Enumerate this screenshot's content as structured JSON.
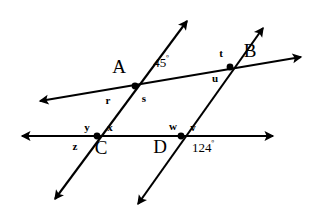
{
  "figure": {
    "type": "geometry-diagram",
    "background_color": "#ffffff",
    "stroke_color": "#000000",
    "lines": [
      {
        "name": "line-through-A-and-B",
        "x1": 40,
        "y1": 101,
        "x2": 301,
        "y2": 57,
        "arrow_start": true,
        "arrow_end": true
      },
      {
        "name": "line-through-C-and-D",
        "x1": 22,
        "y1": 136,
        "x2": 273,
        "y2": 136,
        "arrow_start": true,
        "arrow_end": true
      },
      {
        "name": "transversal-through-A-and-C",
        "x1": 187,
        "y1": 21,
        "x2": 55,
        "y2": 199,
        "arrow_start": true,
        "arrow_end": true
      },
      {
        "name": "transversal-through-B-and-D",
        "x1": 263,
        "y1": 28,
        "x2": 138,
        "y2": 204,
        "arrow_start": true,
        "arrow_end": true
      }
    ],
    "vertices": [
      {
        "name": "vertex-A",
        "x": 135,
        "y": 86
      },
      {
        "name": "vertex-B",
        "x": 230,
        "y": 67
      },
      {
        "name": "vertex-C",
        "x": 97,
        "y": 136
      },
      {
        "name": "vertex-D",
        "x": 181,
        "y": 136
      }
    ],
    "point_labels": [
      {
        "name": "point-label-A",
        "text": "A",
        "x": 119,
        "y": 66
      },
      {
        "name": "point-label-B",
        "text": "B",
        "x": 250,
        "y": 50
      },
      {
        "name": "point-label-C",
        "text": "C",
        "x": 101,
        "y": 147
      },
      {
        "name": "point-label-D",
        "text": "D",
        "x": 160,
        "y": 146
      }
    ],
    "angle_measures": [
      {
        "name": "angle-measure-45",
        "value": "45",
        "unit": "º",
        "x": 161,
        "y": 62
      },
      {
        "name": "angle-measure-124",
        "value": "124",
        "unit": "º",
        "x": 203,
        "y": 147
      }
    ],
    "angle_labels": [
      {
        "name": "angle-label-r",
        "text": "r",
        "x": 108,
        "y": 100
      },
      {
        "name": "angle-label-s",
        "text": "s",
        "x": 144,
        "y": 98
      },
      {
        "name": "angle-label-t",
        "text": "t",
        "x": 221,
        "y": 53
      },
      {
        "name": "angle-label-u",
        "text": "u",
        "x": 215,
        "y": 78
      },
      {
        "name": "angle-label-y",
        "text": "y",
        "x": 87,
        "y": 127
      },
      {
        "name": "angle-label-x",
        "text": "x",
        "x": 110,
        "y": 127
      },
      {
        "name": "angle-label-z",
        "text": "z",
        "x": 75,
        "y": 146
      },
      {
        "name": "angle-label-w",
        "text": "w",
        "x": 173,
        "y": 126
      },
      {
        "name": "angle-label-v",
        "text": "v",
        "x": 193,
        "y": 127
      }
    ]
  }
}
